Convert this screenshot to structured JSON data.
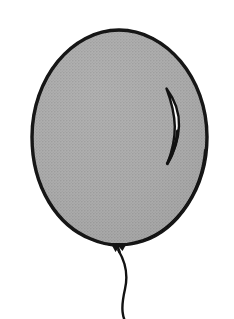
{
  "image": {
    "kind": "line-drawing",
    "subject": "balloon",
    "width": 234,
    "height": 319,
    "background_color": "#ffffff",
    "alt_text": "Black and white line drawing of a gray balloon with a knot and a long curling string"
  },
  "palette": {
    "background": "#ffffff",
    "balloon_fill": "#a9a9a9",
    "balloon_fill_shade": "#9d9d9d",
    "outline": "#141414",
    "ink": "#101010",
    "highlight_white": "#fbfbfb",
    "halftone_dot": "#8f8f8f"
  },
  "geometry": {
    "balloon_body": {
      "center_x": 119,
      "center_y": 137,
      "radius_x": 87,
      "radius_y": 107,
      "top_y": 30,
      "bottom_y": 244,
      "left_x": 32,
      "right_x": 207,
      "outline_width": 3.4
    },
    "knot": {
      "x": 117,
      "y": 247,
      "width": 18,
      "height": 10
    },
    "highlight": {
      "top_x": 167,
      "top_y": 88,
      "bottom_x": 167,
      "bottom_y": 164,
      "bulge_x": 179,
      "max_width": 6
    },
    "string": {
      "start_x": 118,
      "start_y": 251,
      "end_x": 124,
      "end_y": 319,
      "stroke_width": 2.4
    }
  },
  "parts": [
    {
      "id": "balloon-body",
      "label": "Balloon body"
    },
    {
      "id": "balloon-outline",
      "label": "Balloon outline"
    },
    {
      "id": "balloon-highlight",
      "label": "Balloon highlight"
    },
    {
      "id": "balloon-knot",
      "label": "Balloon knot"
    },
    {
      "id": "balloon-string",
      "label": "Balloon string"
    }
  ]
}
